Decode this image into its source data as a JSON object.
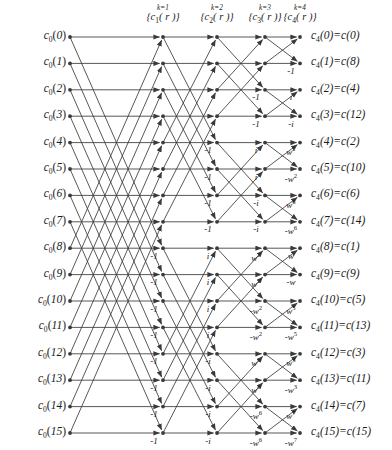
{
  "figure": {
    "background_color": "#ffffff",
    "line_color": "#3a3a3a",
    "text_color": "#1a1a1a",
    "rows": 16,
    "stages": 4
  },
  "geometry": {
    "row_y_start": 37,
    "row_spacing": 26.4,
    "input_node_x": 70,
    "stage_node_x": [
      163,
      217,
      265,
      300
    ],
    "output_label_x": 311
  },
  "headers": [
    {
      "k_label": "k=1",
      "set_label": "{c₁( r )}",
      "sub": "1",
      "x": 163
    },
    {
      "k_label": "k=2",
      "set_label": "{c₂( r )}",
      "sub": "2",
      "x": 217
    },
    {
      "k_label": "k=3",
      "set_label": "{c₃( r )}",
      "sub": "3",
      "x": 265
    },
    {
      "k_label": "k=4",
      "set_label": "{c₄( r )}",
      "sub": "4",
      "x": 300
    }
  ],
  "inputs": [
    {
      "prefix": "c",
      "sub": "0",
      "index": "0"
    },
    {
      "prefix": "c",
      "sub": "0",
      "index": "1"
    },
    {
      "prefix": "c",
      "sub": "0",
      "index": "2"
    },
    {
      "prefix": "c",
      "sub": "0",
      "index": "3"
    },
    {
      "prefix": "c",
      "sub": "0",
      "index": "4"
    },
    {
      "prefix": "c",
      "sub": "0",
      "index": "5"
    },
    {
      "prefix": "c",
      "sub": "0",
      "index": "6"
    },
    {
      "prefix": "c",
      "sub": "0",
      "index": "7"
    },
    {
      "prefix": "c",
      "sub": "0",
      "index": "8"
    },
    {
      "prefix": "c",
      "sub": "0",
      "index": "9"
    },
    {
      "prefix": "c",
      "sub": "0",
      "index": "10"
    },
    {
      "prefix": "c",
      "sub": "0",
      "index": "11"
    },
    {
      "prefix": "c",
      "sub": "0",
      "index": "12"
    },
    {
      "prefix": "c",
      "sub": "0",
      "index": "13"
    },
    {
      "prefix": "c",
      "sub": "0",
      "index": "14"
    },
    {
      "prefix": "c",
      "sub": "0",
      "index": "15"
    }
  ],
  "outputs": [
    {
      "out_index": "0",
      "src_index": "0"
    },
    {
      "out_index": "1",
      "src_index": "8"
    },
    {
      "out_index": "2",
      "src_index": "4"
    },
    {
      "out_index": "3",
      "src_index": "12"
    },
    {
      "out_index": "4",
      "src_index": "2"
    },
    {
      "out_index": "5",
      "src_index": "10"
    },
    {
      "out_index": "6",
      "src_index": "6"
    },
    {
      "out_index": "7",
      "src_index": "14"
    },
    {
      "out_index": "8",
      "src_index": "1"
    },
    {
      "out_index": "9",
      "src_index": "9"
    },
    {
      "out_index": "10",
      "src_index": "5"
    },
    {
      "out_index": "11",
      "src_index": "13"
    },
    {
      "out_index": "12",
      "src_index": "3"
    },
    {
      "out_index": "13",
      "src_index": "11"
    },
    {
      "out_index": "14",
      "src_index": "7"
    },
    {
      "out_index": "15",
      "src_index": "15"
    }
  ],
  "twiddles": {
    "stage1": [
      "",
      "",
      "",
      "",
      "",
      "",
      "",
      "",
      "-1",
      "-1",
      "-1",
      "-1",
      "-1",
      "-1",
      "-1",
      "-1"
    ],
    "stage2": [
      "",
      "",
      "",
      "",
      "-1",
      "-1",
      "-1",
      "-1",
      "i",
      "i",
      "i",
      "i",
      "-i",
      "-i",
      "-i",
      "-i"
    ],
    "stage3": [
      "",
      "",
      "-1",
      "-1",
      "i",
      "i",
      "-i",
      "-i",
      "w2",
      "w2",
      "-w2",
      "-w2",
      "w6",
      "w6",
      "-w6",
      "-w6"
    ],
    "stage4": [
      "",
      "-1",
      "i",
      "-i",
      "w2",
      "-w2",
      "w6",
      "-w6",
      "w",
      "-w",
      "w5",
      "-w5",
      "w3",
      "-w3",
      "w7",
      "-w7"
    ]
  },
  "twiddle_glyphs": {
    "-1": {
      "base": "-1",
      "exp": ""
    },
    "i": {
      "base": "i",
      "exp": ""
    },
    "-i": {
      "base": "-i",
      "exp": ""
    },
    "w": {
      "base": "w",
      "exp": ""
    },
    "-w": {
      "base": "-w",
      "exp": ""
    },
    "w2": {
      "base": "w",
      "exp": "2"
    },
    "-w2": {
      "base": "-w",
      "exp": "2"
    },
    "w3": {
      "base": "w",
      "exp": "3"
    },
    "-w3": {
      "base": "-w",
      "exp": "3"
    },
    "w5": {
      "base": "w",
      "exp": "5"
    },
    "-w5": {
      "base": "-w",
      "exp": "5"
    },
    "w6": {
      "base": "w",
      "exp": "6"
    },
    "-w6": {
      "base": "-w",
      "exp": "6"
    },
    "w7": {
      "base": "w",
      "exp": "7"
    },
    "-w7": {
      "base": "-w",
      "exp": "7"
    }
  },
  "butterfly_spans": [
    8,
    4,
    2,
    1
  ]
}
